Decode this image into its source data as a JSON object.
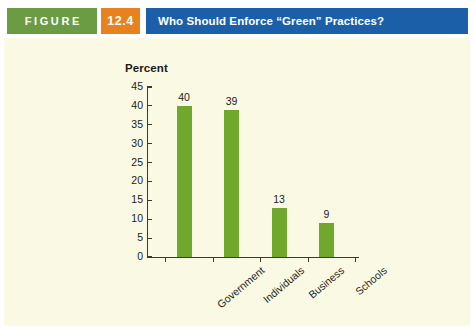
{
  "header": {
    "figure_label": "FIGURE",
    "figure_number": "12.4",
    "title": "Who Should Enforce “Green” Practices?",
    "colors": {
      "figure_box": "#6b9c43",
      "number_box": "#e8821e",
      "title_bar": "#1a5fa8"
    }
  },
  "panel": {
    "background": "#fafae4"
  },
  "chart_data": {
    "type": "bar",
    "title": "",
    "ylabel": "Percent",
    "xlabel": "",
    "categories": [
      "Government",
      "Individuals",
      "Business",
      "Schools"
    ],
    "values": [
      40,
      39,
      13,
      9
    ],
    "ylim": [
      0,
      45
    ],
    "ytick_labels": [
      "45",
      "40",
      "35",
      "30",
      "25",
      "20",
      "15",
      "10",
      "5",
      "0"
    ],
    "ytick_values": [
      45,
      40,
      35,
      30,
      25,
      20,
      15,
      10,
      5,
      0
    ],
    "grid": false,
    "legend": "none",
    "bar_color": "#6fa82c",
    "data_labels": [
      "40",
      "39",
      "13",
      "9"
    ]
  }
}
